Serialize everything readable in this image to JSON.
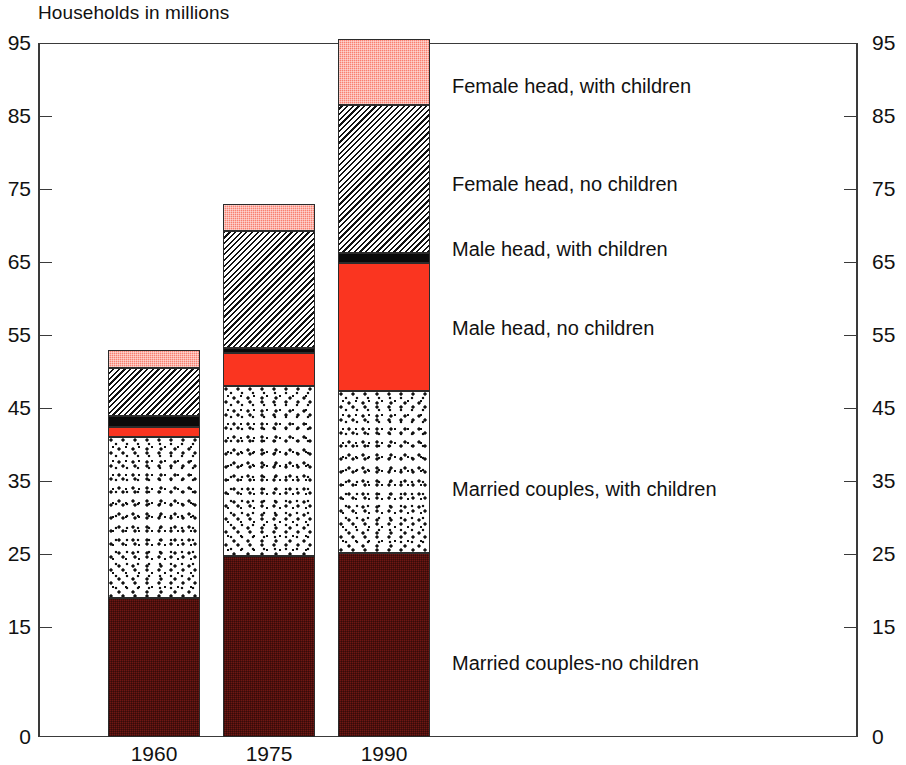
{
  "chart_data": {
    "type": "bar",
    "subtype": "stacked-bar",
    "title": "Households in millions",
    "xlabel": "",
    "ylabel": "",
    "ylim": [
      0,
      95
    ],
    "yticks": [
      0,
      15,
      25,
      35,
      45,
      55,
      65,
      75,
      85,
      95
    ],
    "ytick_labels": [
      "0",
      "15",
      "25",
      "35",
      "45",
      "55",
      "65",
      "75",
      "85",
      "95"
    ],
    "right_axis": true,
    "right_ytick_labels": [
      "0",
      "15",
      "25",
      "35",
      "45",
      "55",
      "65",
      "75",
      "85",
      "95"
    ],
    "grid": false,
    "legend_position": "right-callouts",
    "categories": [
      "1960",
      "1975",
      "1990"
    ],
    "series": [
      {
        "name": "Married couples-no children",
        "color": "#6e1713",
        "pattern": "dense-dark-red-stipple",
        "values": [
          19.0,
          24.8,
          25.2
        ]
      },
      {
        "name": "Married couples, with children",
        "color": "#ffffff",
        "pattern": "black-speckle-on-white",
        "values": [
          22.0,
          23.2,
          22.2
        ]
      },
      {
        "name": "Male head, no children",
        "color": "#fa3520",
        "pattern": "solid-red",
        "values": [
          1.5,
          4.5,
          17.5
        ]
      },
      {
        "name": "Male head, with children",
        "color": "#0a0a0a",
        "pattern": "solid-black",
        "values": [
          1.5,
          0.8,
          1.4
        ]
      },
      {
        "name": "Female head, no children",
        "color": "#ffffff",
        "pattern": "diagonal-hatch",
        "values": [
          6.5,
          16.0,
          20.2
        ]
      },
      {
        "name": "Female head, with children",
        "color": "#f98070",
        "pattern": "light-pink-stipple",
        "values": [
          2.5,
          3.7,
          9.0
        ]
      }
    ],
    "totals": [
      53.0,
      73.0,
      95.5
    ]
  },
  "legend_callouts": [
    {
      "label": "Female head, with children",
      "top": 76,
      "left": 452
    },
    {
      "label": "Female head, no children",
      "top": 174,
      "left": 452
    },
    {
      "label": "Male head, with children",
      "top": 239,
      "left": 452
    },
    {
      "label": "Male head, no children",
      "top": 318,
      "left": 452
    },
    {
      "label": "Married couples, with children",
      "top": 479,
      "left": 452
    },
    {
      "label": "Married couples-no children",
      "top": 653,
      "left": 452
    }
  ]
}
